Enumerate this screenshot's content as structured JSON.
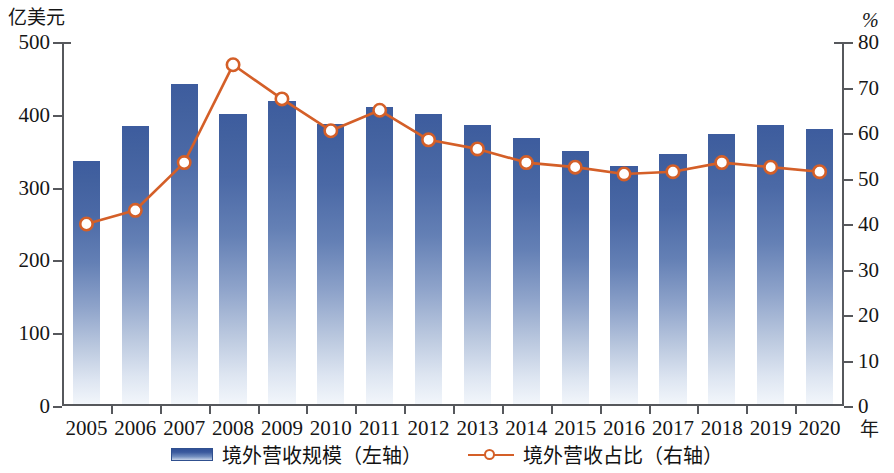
{
  "axes": {
    "left_unit": "亿美元",
    "right_unit": "%",
    "x_unit": "年",
    "left_ticks": [
      "500",
      "400",
      "300",
      "200",
      "100",
      "0"
    ],
    "right_ticks": [
      "80",
      "70",
      "60",
      "50",
      "40",
      "30",
      "20",
      "10",
      "0"
    ]
  },
  "legend": {
    "bar_label": "境外营收规模（左轴）",
    "line_label": "境外营收占比（右轴）"
  },
  "colors": {
    "bar_top": "#3d5c9e",
    "bar_bottom": "#f2f6fb",
    "line": "#d45f28",
    "marker_fill": "#ffffff",
    "axis": "#56585c"
  },
  "chart_data": {
    "type": "bar",
    "title": "",
    "xlabel": "年",
    "ylabel": "亿美元",
    "y2label": "%",
    "ylim": [
      0,
      500
    ],
    "y2lim": [
      0,
      80
    ],
    "grid": false,
    "legend_position": "bottom",
    "categories": [
      "2005",
      "2006",
      "2007",
      "2008",
      "2009",
      "2010",
      "2011",
      "2012",
      "2013",
      "2014",
      "2015",
      "2016",
      "2017",
      "2018",
      "2019",
      "2020"
    ],
    "series": [
      {
        "name": "境外营收规模（左轴）",
        "type": "bar",
        "axis": "left",
        "unit": "亿美元",
        "values": [
          334,
          382,
          440,
          398,
          416,
          385,
          408,
          398,
          383,
          365,
          348,
          327,
          343,
          371,
          383,
          378
        ]
      },
      {
        "name": "境外营收占比（右轴）",
        "type": "line",
        "axis": "right",
        "unit": "%",
        "values": [
          40.0,
          43.0,
          53.5,
          75.0,
          67.5,
          60.5,
          65.0,
          58.5,
          56.5,
          53.5,
          52.5,
          51.0,
          51.5,
          53.5,
          52.5,
          51.5
        ]
      }
    ]
  }
}
